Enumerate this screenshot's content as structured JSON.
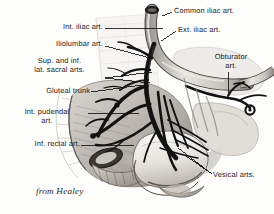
{
  "figure": {
    "credit": "from Healey",
    "background_color": "#fdfdfc",
    "ink_color": "#1a1a1a",
    "leader_color": "#121212",
    "tone_light": "#e2e0dc",
    "tone_mid": "#b9b5ae",
    "tone_dark": "#7d7872",
    "vessel_dark": "#141414"
  },
  "labels": [
    {
      "id": "int-iliac-art",
      "text": "Int. iliac art.",
      "lines": [
        "Int. iliac art."
      ],
      "x": 31,
      "y": 23,
      "width": 72,
      "align": "right",
      "leader_from": [
        105,
        28
      ],
      "leader_to": [
        163,
        28
      ]
    },
    {
      "id": "iliolumbar-art",
      "text": "Iliolumbar art.",
      "lines": [
        "Iliolumbar art."
      ],
      "x": 23,
      "y": 40,
      "width": 80,
      "align": "right",
      "leader_from": [
        105,
        46
      ],
      "leader_to": [
        150,
        58
      ]
    },
    {
      "id": "sup-inf-lat-sacral-arts",
      "text": "Sup. and inf.\nlat. sacral arts.",
      "lines": [
        "Sup. and inf.",
        "lat. sacral arts."
      ],
      "x": 16,
      "y": 57,
      "width": 87,
      "align": "center",
      "leader_from": [
        105,
        78
      ],
      "leader_to": [
        152,
        73
      ]
    },
    {
      "id": "gluteal-trunk",
      "text": "Gluteal trunk",
      "lines": [
        "Gluteal trunk"
      ],
      "x": 12,
      "y": 87,
      "width": 78,
      "align": "right",
      "leader_from": [
        91,
        92
      ],
      "leader_to": [
        140,
        84
      ]
    },
    {
      "id": "int-pudendal-art",
      "text": "Int. pudendal\nart.",
      "lines": [
        "Int. pudendal",
        "art."
      ],
      "x": 7,
      "y": 108,
      "width": 80,
      "align": "center",
      "leader_from": [
        88,
        113
      ],
      "leader_to": [
        137,
        113
      ]
    },
    {
      "id": "inf-rectal-art",
      "text": "Inf. rectal art.",
      "lines": [
        "Inf. rectal art."
      ],
      "x": 2,
      "y": 140,
      "width": 78,
      "align": "right",
      "leader_from": [
        81,
        145
      ],
      "leader_to": [
        133,
        145
      ]
    },
    {
      "id": "common-iliac-art",
      "text": "Common iliac art.",
      "lines": [
        "Common iliac art."
      ],
      "x": 174,
      "y": 7,
      "width": 96,
      "align": "left",
      "leader_from": [
        172,
        12
      ],
      "leader_to": [
        163,
        15
      ]
    },
    {
      "id": "ext-iliac-art",
      "text": "Ext. iliac art.",
      "lines": [
        "Ext. iliac art."
      ],
      "x": 178,
      "y": 26,
      "width": 80,
      "align": "left",
      "leader_from": [
        176,
        31
      ],
      "leader_to": [
        161,
        40
      ]
    },
    {
      "id": "obturator-art",
      "text": "Obturator\nart.",
      "lines": [
        "Obturator",
        "art."
      ],
      "x": 203,
      "y": 53,
      "width": 56,
      "align": "center",
      "leader_from": [
        228,
        72
      ],
      "leader_to": [
        228,
        96
      ]
    },
    {
      "id": "vesical-arts",
      "text": "Vesical arts.",
      "lines": [
        "Vesical arts."
      ],
      "x": 213,
      "y": 171,
      "width": 62,
      "align": "left",
      "leader_from": [
        212,
        175
      ],
      "leader_to": [
        176,
        149
      ]
    }
  ]
}
